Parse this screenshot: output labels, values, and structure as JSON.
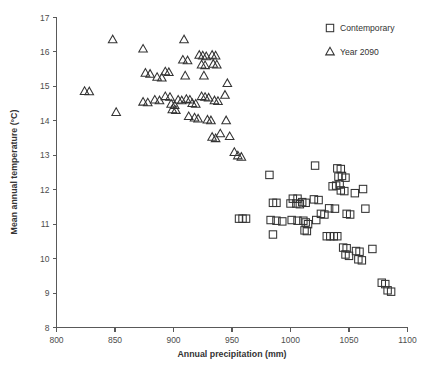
{
  "chart_data": {
    "type": "scatter",
    "title": "",
    "xlabel": "Annual precipitation (mm)",
    "ylabel": "Mean annual temperature (°C)",
    "xlim": [
      800,
      1100
    ],
    "ylim": [
      8,
      17
    ],
    "xticks": [
      800,
      850,
      900,
      950,
      1000,
      1050,
      1100
    ],
    "yticks": [
      8,
      9,
      10,
      11,
      12,
      13,
      14,
      15,
      16,
      17
    ],
    "grid": false,
    "legend_position": "top-right",
    "marker_color": "#333333",
    "axis_color": "#595959",
    "series": [
      {
        "name": "Contemporary",
        "marker": "square",
        "points": [
          [
            956,
            11.16
          ],
          [
            959,
            11.16
          ],
          [
            962,
            11.16
          ],
          [
            982,
            12.43
          ],
          [
            985,
            11.62
          ],
          [
            988,
            11.62
          ],
          [
            983,
            11.12
          ],
          [
            988,
            11.1
          ],
          [
            993,
            11.08
          ],
          [
            985,
            10.7
          ],
          [
            1002,
            11.74
          ],
          [
            1006,
            11.74
          ],
          [
            1000,
            11.6
          ],
          [
            1005,
            11.6
          ],
          [
            1008,
            11.58
          ],
          [
            1001,
            11.12
          ],
          [
            1006,
            11.1
          ],
          [
            1010,
            11.64
          ],
          [
            1013,
            11.62
          ],
          [
            1011,
            11.1
          ],
          [
            1013,
            11.05
          ],
          [
            1015,
            11.0
          ],
          [
            1012,
            10.82
          ],
          [
            1014,
            10.8
          ],
          [
            1021,
            12.7
          ],
          [
            1020,
            11.72
          ],
          [
            1024,
            11.7
          ],
          [
            1022,
            11.12
          ],
          [
            1026,
            11.3
          ],
          [
            1029,
            11.28
          ],
          [
            1031,
            10.65
          ],
          [
            1034,
            10.65
          ],
          [
            1037,
            10.65
          ],
          [
            1040,
            10.65
          ],
          [
            1033,
            11.46
          ],
          [
            1038,
            11.45
          ],
          [
            1036,
            12.1
          ],
          [
            1039,
            12.12
          ],
          [
            1042,
            12.15
          ],
          [
            1041,
            12.38
          ],
          [
            1044,
            12.4
          ],
          [
            1047,
            12.35
          ],
          [
            1043,
            11.98
          ],
          [
            1046,
            11.96
          ],
          [
            1040,
            12.62
          ],
          [
            1043,
            12.6
          ],
          [
            1048,
            11.3
          ],
          [
            1051,
            11.28
          ],
          [
            1045,
            10.32
          ],
          [
            1048,
            10.3
          ],
          [
            1047,
            10.12
          ],
          [
            1050,
            10.08
          ],
          [
            1055,
            11.9
          ],
          [
            1056,
            10.22
          ],
          [
            1059,
            10.2
          ],
          [
            1058,
            9.98
          ],
          [
            1061,
            9.95
          ],
          [
            1062,
            12.02
          ],
          [
            1064,
            11.45
          ],
          [
            1070,
            10.28
          ],
          [
            1078,
            9.3
          ],
          [
            1081,
            9.26
          ],
          [
            1083,
            9.08
          ],
          [
            1086,
            9.04
          ]
        ]
      },
      {
        "name": "Year 2090",
        "marker": "triangle",
        "points": [
          [
            824,
            14.85
          ],
          [
            828,
            14.84
          ],
          [
            848,
            16.35
          ],
          [
            851,
            14.24
          ],
          [
            874,
            16.08
          ],
          [
            876,
            15.38
          ],
          [
            880,
            15.35
          ],
          [
            874,
            14.54
          ],
          [
            878,
            14.52
          ],
          [
            884,
            14.6
          ],
          [
            888,
            14.58
          ],
          [
            886,
            15.26
          ],
          [
            890,
            15.24
          ],
          [
            893,
            15.42
          ],
          [
            896,
            15.4
          ],
          [
            893,
            14.7
          ],
          [
            897,
            14.68
          ],
          [
            898,
            14.48
          ],
          [
            901,
            14.44
          ],
          [
            899,
            14.32
          ],
          [
            902,
            14.3
          ],
          [
            904,
            14.6
          ],
          [
            907,
            14.58
          ],
          [
            909,
            16.35
          ],
          [
            908,
            15.76
          ],
          [
            912,
            15.74
          ],
          [
            910,
            15.3
          ],
          [
            911,
            14.62
          ],
          [
            914,
            14.6
          ],
          [
            916,
            14.5
          ],
          [
            919,
            14.48
          ],
          [
            913,
            14.12
          ],
          [
            918,
            14.08
          ],
          [
            921,
            14.05
          ],
          [
            922,
            15.9
          ],
          [
            925,
            15.88
          ],
          [
            928,
            15.86
          ],
          [
            924,
            15.62
          ],
          [
            927,
            15.6
          ],
          [
            926,
            15.3
          ],
          [
            924,
            14.7
          ],
          [
            927,
            14.68
          ],
          [
            930,
            14.66
          ],
          [
            929,
            14.02
          ],
          [
            932,
            14.0
          ],
          [
            933,
            15.9
          ],
          [
            936,
            15.88
          ],
          [
            934,
            15.64
          ],
          [
            937,
            15.62
          ],
          [
            935,
            14.58
          ],
          [
            938,
            14.56
          ],
          [
            933,
            13.52
          ],
          [
            936,
            13.48
          ],
          [
            940,
            13.62
          ],
          [
            944,
            14.74
          ],
          [
            946,
            15.08
          ],
          [
            945,
            14.0
          ],
          [
            948,
            13.54
          ],
          [
            952,
            13.08
          ],
          [
            955,
            12.98
          ],
          [
            958,
            12.94
          ]
        ]
      }
    ]
  },
  "legend": {
    "items": [
      {
        "label": "Contemporary",
        "marker": "square"
      },
      {
        "label": "Year 2090",
        "marker": "triangle"
      }
    ]
  }
}
